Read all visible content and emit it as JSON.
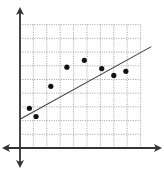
{
  "chart_data": {
    "type": "scatter",
    "title": "",
    "xlabel": "",
    "ylabel": "",
    "grid": true,
    "grid_style": "dotted",
    "xlim": [
      0,
      9
    ],
    "ylim": [
      0,
      9
    ],
    "x_ticks": [
      1,
      2,
      3,
      4,
      5,
      6,
      7,
      8,
      9
    ],
    "y_ticks": [
      1,
      2,
      3,
      4,
      5,
      6,
      7,
      8,
      9
    ],
    "tick_labels_shown": false,
    "legend": null,
    "series": [
      {
        "name": "points",
        "kind": "scatter",
        "x": [
          0.7,
          1.2,
          2.3,
          3.5,
          4.8,
          6.1,
          7.0,
          7.9
        ],
        "y": [
          2.9,
          2.3,
          4.5,
          5.9,
          6.4,
          5.8,
          5.3,
          5.6
        ]
      },
      {
        "name": "trend line",
        "kind": "line",
        "x": [
          0,
          9.8
        ],
        "y": [
          2.1,
          7.4
        ]
      }
    ],
    "axes": {
      "x_arrows": "both",
      "y_arrows": "both"
    }
  },
  "colors": {
    "axis": "#333333",
    "grid": "#9a9a9a",
    "point": "#111111",
    "line": "#444444",
    "background": "#ffffff"
  },
  "layout": {
    "origin_px": [
      20,
      148
    ],
    "unit_px_x": 13.4,
    "unit_px_y": 13.7,
    "grid_cols": 9,
    "grid_rows": 9
  }
}
